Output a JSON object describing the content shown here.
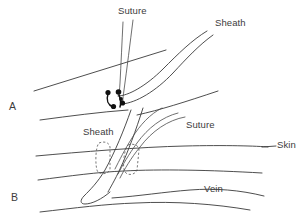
{
  "figure": {
    "kind": "medical-line-diagram",
    "background_color": "#ffffff",
    "line_color": "#3a3a3a",
    "dash_color": "#555555",
    "knot_color": "#111111",
    "panels": [
      {
        "id": "A",
        "panel_label": "A",
        "labels": [
          {
            "name": "suture",
            "text": "Suture"
          },
          {
            "name": "sheath",
            "text": "Sheath"
          }
        ],
        "elements": [
          "suture-threads",
          "sheath-tube",
          "skin-line-upper",
          "skin-line-lower",
          "suture-knot"
        ]
      },
      {
        "id": "B",
        "panel_label": "B",
        "labels": [
          {
            "name": "sheath",
            "text": "Sheath"
          },
          {
            "name": "suture",
            "text": "Suture"
          },
          {
            "name": "skin",
            "text": "Skin"
          },
          {
            "name": "vein",
            "text": "Vein"
          }
        ],
        "elements": [
          "sheath-tube",
          "suture-threads",
          "skin-line",
          "vein-tube",
          "dashed-marker-left",
          "dashed-marker-right",
          "skin-leader-line"
        ]
      }
    ]
  },
  "labels": {
    "panel_a": "A",
    "panel_b": "B",
    "suture_a": "Suture",
    "sheath_a": "Sheath",
    "sheath_b": "Sheath",
    "suture_b": "Suture",
    "skin_b": "Skin",
    "vein_b": "Vein"
  }
}
